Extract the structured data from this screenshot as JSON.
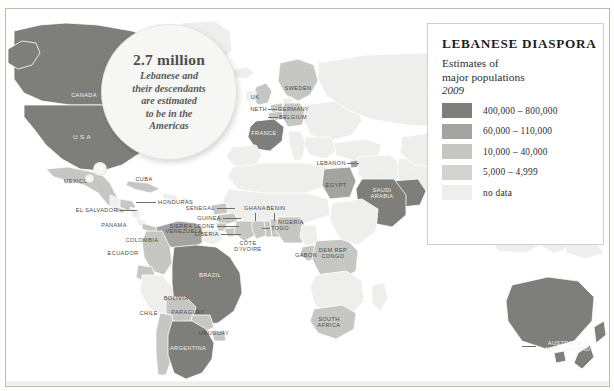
{
  "legend": {
    "title": "LEBANESE DIASPORA",
    "subtitle_line1": "Estimates of",
    "subtitle_line2": "major populations",
    "year": "2009",
    "entries": [
      {
        "label": "400,000 – 800,000",
        "color": "#7e7e7a"
      },
      {
        "label": "60,000 – 110,000",
        "color": "#a3a3a0"
      },
      {
        "label": "10,000 – 40,000",
        "color": "#c6c6c3"
      },
      {
        "label": "5,000 – 4,999",
        "color": "#d3d3d0"
      },
      {
        "label": "no data",
        "color": "#eeeeec"
      }
    ]
  },
  "callout": {
    "headline": "2.7 million",
    "line1": "Lebanese and",
    "line2": "their descendants",
    "line3": "are estimated",
    "line4": "to be in the",
    "line5": "Americas"
  },
  "map": {
    "labels": [
      {
        "id": "canada",
        "text": "CANADA"
      },
      {
        "id": "usa",
        "text": "U S A"
      },
      {
        "id": "mexico",
        "text": "MEXICO"
      },
      {
        "id": "cuba",
        "text": "CUBA"
      },
      {
        "id": "honduras",
        "text": "HONDURAS"
      },
      {
        "id": "el-salvador",
        "text": "EL SALVADOR"
      },
      {
        "id": "panama",
        "text": "PANAMA"
      },
      {
        "id": "venezuela",
        "text": "VENEZUELA"
      },
      {
        "id": "colombia",
        "text": "COLOMBIA"
      },
      {
        "id": "ecuador",
        "text": "ECUADOR"
      },
      {
        "id": "brazil",
        "text": "BRAZIL"
      },
      {
        "id": "bolivia",
        "text": "BOLIVIA"
      },
      {
        "id": "chile",
        "text": "CHILE"
      },
      {
        "id": "paraguay",
        "text": "PARAGUAY"
      },
      {
        "id": "uruguay",
        "text": "URUGUAY"
      },
      {
        "id": "argentina",
        "text": "ARGENTINA"
      },
      {
        "id": "uk",
        "text": "UK"
      },
      {
        "id": "sweden",
        "text": "SWEDEN"
      },
      {
        "id": "netherlands",
        "text": "NETH"
      },
      {
        "id": "germany",
        "text": "GERMANY"
      },
      {
        "id": "belgium",
        "text": "BELGIUM"
      },
      {
        "id": "france",
        "text": "FRANCE"
      },
      {
        "id": "lebanon",
        "text": "LEBANON"
      },
      {
        "id": "egypt",
        "text": "EGYPT"
      },
      {
        "id": "gulf-states",
        "text": "other Gulf States"
      },
      {
        "id": "saudi-arabia",
        "text": "SAUDI\nARABIA"
      },
      {
        "id": "senegal",
        "text": "SENEGAL"
      },
      {
        "id": "guinea",
        "text": "GUINEA"
      },
      {
        "id": "sierra-leone",
        "text": "SIERRA LEONE"
      },
      {
        "id": "liberia",
        "text": "LIBERIA"
      },
      {
        "id": "cote-divoire",
        "text": "CÔTE\nD’IVOIRE"
      },
      {
        "id": "ghana",
        "text": "GHANA"
      },
      {
        "id": "togo",
        "text": "TOGO"
      },
      {
        "id": "benin",
        "text": "BENIN"
      },
      {
        "id": "nigeria",
        "text": "NIGERIA"
      },
      {
        "id": "gabon",
        "text": "GABON"
      },
      {
        "id": "dem-rep-congo",
        "text": "DEM REP\nCONGO"
      },
      {
        "id": "south-africa",
        "text": "SOUTH\nAFRICA"
      },
      {
        "id": "australia-nz",
        "text": "AUSTRALIA &\nNEW ZEALAND"
      }
    ]
  }
}
